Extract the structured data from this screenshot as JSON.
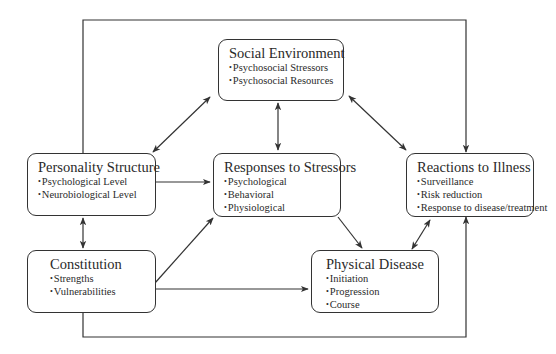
{
  "diagram": {
    "nodes": {
      "social_environment": {
        "title": "Social Environment",
        "items": [
          "Psychosocial Stressors",
          "Psychosocial Resources"
        ]
      },
      "personality_structure": {
        "title": "Personality Structure",
        "items": [
          "Psychological Level",
          "Neurobiological Level"
        ]
      },
      "responses_to_stressors": {
        "title": "Responses to Stressors",
        "items": [
          "Psychological",
          "Behavioral",
          "Physiological"
        ]
      },
      "reactions_to_illness": {
        "title": "Reactions to Illness",
        "items": [
          "Surveillance",
          "Risk reduction",
          "Response to disease/treatment"
        ]
      },
      "constitution": {
        "title": "Constitution",
        "items": [
          "Strengths",
          "Vulnerabilities"
        ]
      },
      "physical_disease": {
        "title": "Physical Disease",
        "items": [
          "Initiation",
          "Progression",
          "Course"
        ]
      }
    },
    "edges": [
      {
        "from": "Personality Structure",
        "to": "Social Environment",
        "type": "bidirectional"
      },
      {
        "from": "Social Environment",
        "to": "Responses to Stressors",
        "type": "bidirectional"
      },
      {
        "from": "Social Environment",
        "to": "Reactions to Illness",
        "type": "bidirectional"
      },
      {
        "from": "Personality Structure",
        "to": "Responses to Stressors",
        "type": "directed"
      },
      {
        "from": "Personality Structure",
        "to": "Constitution",
        "type": "bidirectional"
      },
      {
        "from": "Personality Structure",
        "to": "Reactions to Illness",
        "type": "directed",
        "route": "top loop"
      },
      {
        "from": "Constitution",
        "to": "Responses to Stressors",
        "type": "directed"
      },
      {
        "from": "Constitution",
        "to": "Physical Disease",
        "type": "directed"
      },
      {
        "from": "Constitution",
        "to": "Reactions to Illness",
        "type": "directed",
        "route": "bottom loop"
      },
      {
        "from": "Responses to Stressors",
        "to": "Physical Disease",
        "type": "directed"
      },
      {
        "from": "Physical Disease",
        "to": "Reactions to Illness",
        "type": "bidirectional"
      }
    ],
    "colors": {
      "line": "#333333",
      "background": "#ffffff"
    }
  }
}
